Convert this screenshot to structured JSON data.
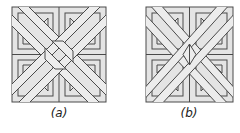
{
  "figures": [
    {
      "id": "a",
      "caption": "(a)",
      "variant": "interwoven"
    },
    {
      "id": "b",
      "caption": "(b)",
      "variant": "lattice"
    }
  ],
  "colors": {
    "fill": "#e4e4e4",
    "band_fill": "#ececec",
    "stroke": "#4a4a4a",
    "background": "#ffffff"
  }
}
